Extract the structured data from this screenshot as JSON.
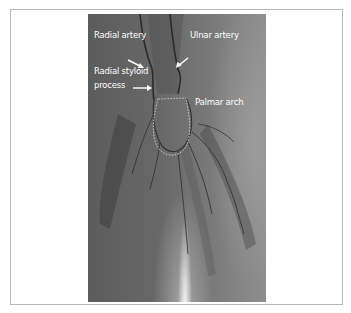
{
  "figure": {
    "labels": {
      "radial_artery": "Radial artery",
      "ulnar_artery": "Ulnar artery",
      "radial_styloid_line1": "Radial styloid",
      "radial_styloid_line2": "process",
      "palmar_arch": "Palmar arch"
    },
    "colors": {
      "label_text": "#ffffff",
      "frame_border": "#b8b8b8",
      "xray_base": "#686868"
    }
  }
}
